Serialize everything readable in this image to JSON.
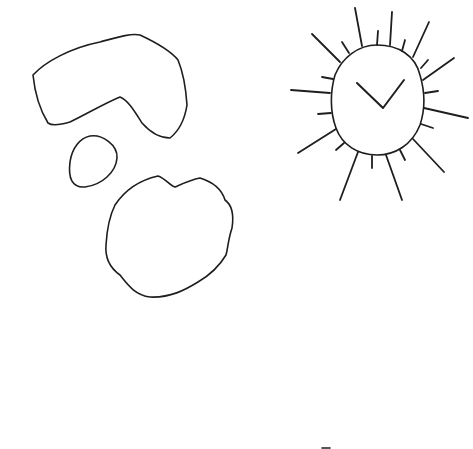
{
  "drawing": {
    "description": "Hand-drawn line sketch: a bean/boomerang shape, a small oval, a bumpy round blob, and a sun with a check mark inside",
    "stroke_color": "#1e1e1e",
    "background_color": "#ffffff",
    "shapes": [
      {
        "name": "boomerang-shape"
      },
      {
        "name": "small-oval"
      },
      {
        "name": "bumpy-blob"
      },
      {
        "name": "sun",
        "inner_mark": "check-mark"
      }
    ]
  }
}
